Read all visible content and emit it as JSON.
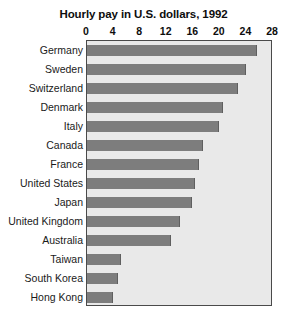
{
  "chart_data": {
    "type": "bar",
    "orientation": "horizontal",
    "title": "Hourly pay in U.S. dollars, 1992",
    "xlabel": "",
    "ylabel": "",
    "xlim": [
      0,
      28
    ],
    "xticks": [
      0,
      4,
      8,
      12,
      16,
      20,
      24,
      28
    ],
    "grid": false,
    "legend": "none",
    "bar_color": "#7d7d7d",
    "plot_background": "#e9e9e9",
    "categories": [
      "Germany",
      "Sweden",
      "Switzerland",
      "Denmark",
      "Italy",
      "Canada",
      "France",
      "United States",
      "Japan",
      "United Kingdom",
      "Australia",
      "Taiwan",
      "South Korea",
      "Hong Kong"
    ],
    "values": [
      25.6,
      24.0,
      22.8,
      20.5,
      19.8,
      17.5,
      16.9,
      16.3,
      15.8,
      14.0,
      12.6,
      5.1,
      4.7,
      3.9
    ]
  }
}
